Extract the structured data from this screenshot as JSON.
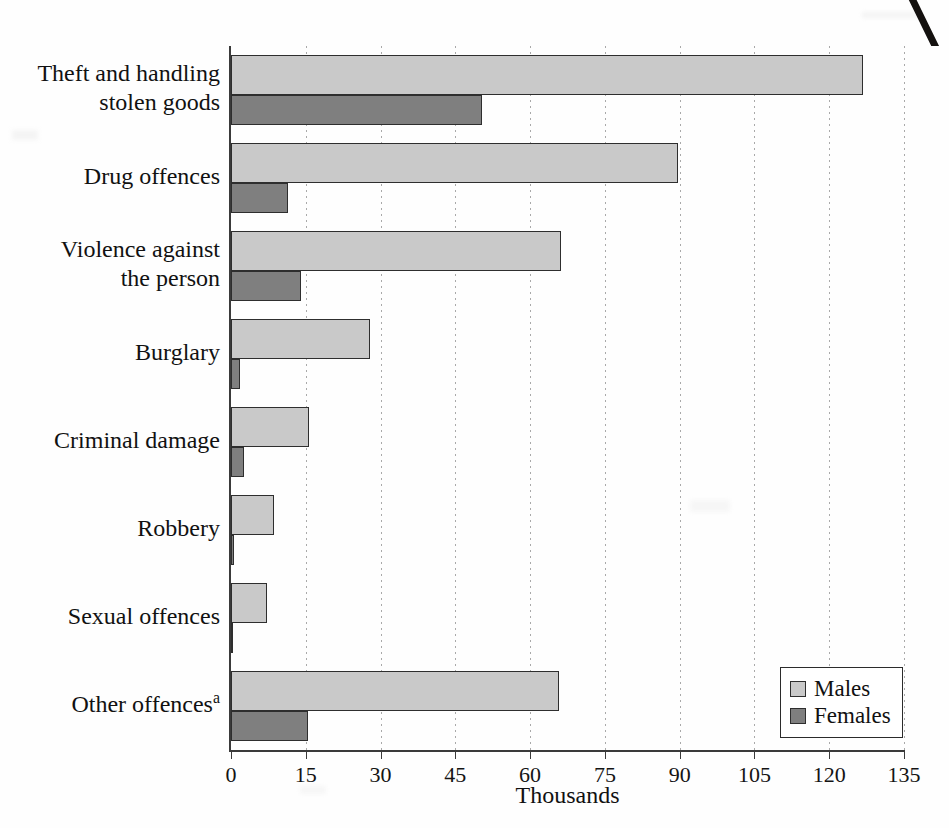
{
  "chart_data": {
    "type": "bar",
    "orientation": "horizontal",
    "title": "",
    "xlabel": "Thousands",
    "ylabel": "",
    "xlim": [
      0,
      135
    ],
    "xticks": [
      0,
      15,
      30,
      45,
      60,
      75,
      90,
      105,
      120,
      135
    ],
    "grid": true,
    "legend_position": "bottom-right",
    "categories": [
      "Theft and handling\nstolen goods",
      "Drug offences",
      "Violence against\nthe person",
      "Burglary",
      "Criminal damage",
      "Robbery",
      "Sexual offences",
      "Other offences"
    ],
    "category_footnotes": [
      "",
      "",
      "",
      "",
      "",
      "",
      "",
      "a"
    ],
    "series": [
      {
        "name": "Males",
        "color": "#c9c9c9",
        "values": [
          126.8,
          89.7,
          66.2,
          27.9,
          15.7,
          8.7,
          7.3,
          65.8
        ]
      },
      {
        "name": "Females",
        "color": "#7f7f7f",
        "values": [
          50.3,
          11.4,
          14.0,
          1.8,
          2.6,
          0.7,
          0.2,
          15.5
        ]
      }
    ]
  },
  "legend": {
    "items": [
      {
        "label": "Males",
        "swatch": "male"
      },
      {
        "label": "Females",
        "swatch": "female"
      }
    ]
  },
  "colors": {
    "male_fill": "#c9c9c9",
    "female_fill": "#7f7f7f",
    "bar_outline": "#2e2e2e",
    "axis": "#3a3a3a",
    "gridline": "#a9a9a9",
    "text": "#111111",
    "background": "#fefefe"
  }
}
